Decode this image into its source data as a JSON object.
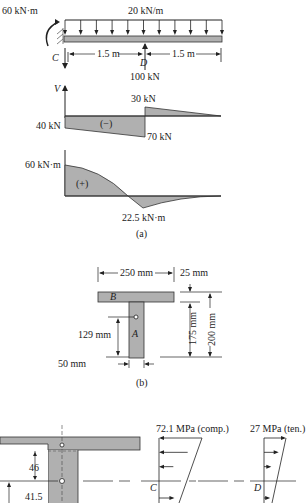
{
  "beam": {
    "moment_label": "60 kN·m",
    "load_label": "20 kN/m",
    "support_label": "C",
    "point_label": "D",
    "span_left_label": "1.5 m",
    "span_right_label": "1.5 m",
    "point_load_label": "100 kN"
  },
  "shear_diagram": {
    "axis_label": "V",
    "left_value_label": "40 kN",
    "sign_label": "(−)",
    "jump_top_label": "30 kN",
    "jump_bottom_label": "70 kN",
    "values_kN": {
      "at_C": -40,
      "at_D_left": -70,
      "at_D_right": 30,
      "at_end": 0
    }
  },
  "moment_diagram": {
    "left_value_label": "60 kN·m",
    "sign_label": "(+)",
    "min_value_label": "22.5 kN·m",
    "values_kNm": {
      "at_C": 60,
      "at_D": -22.5,
      "at_end": 0
    }
  },
  "caption_a": "(a)",
  "section": {
    "width_label": "250 mm",
    "flange_label": "25 mm",
    "web_label": "175 mm",
    "depth_label": "200 mm",
    "centroid_label": "129 mm",
    "web_width_label": "50 mm",
    "flange_part": "B",
    "web_part": "A"
  },
  "caption_b": "(b)",
  "stress": {
    "dim_top": "46",
    "dim_bottom": "41.5",
    "C_label": "C",
    "D_label": "D",
    "C_stress_label": "72.1 MPa (comp.)",
    "D_stress_label": "27 MPa (ten.)"
  }
}
